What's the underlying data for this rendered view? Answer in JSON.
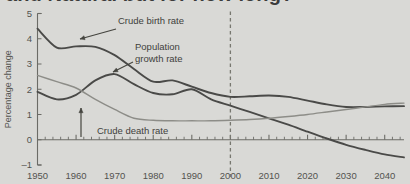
{
  "figure": {
    "title_partial": "and Natural but for how long?",
    "background_color": "#d9d9d6"
  },
  "chart_data": {
    "type": "line",
    "title": "and Natural but for how long?",
    "xlabel": "",
    "ylabel": "Percentage change",
    "x": [
      1950,
      1955,
      1960,
      1965,
      1970,
      1975,
      1980,
      1985,
      1990,
      1995,
      2000,
      2005,
      2010,
      2015,
      2020,
      2025,
      2030,
      2035,
      2040,
      2045
    ],
    "xlim": [
      1950,
      2045
    ],
    "ylim": [
      -1,
      5
    ],
    "xticks": [
      1950,
      1960,
      1970,
      1980,
      1990,
      2000,
      2010,
      2020,
      2030,
      2040
    ],
    "xticklabels": [
      "1950",
      "1960",
      "1970",
      "1980",
      "1990",
      "2000",
      "2010",
      "2020",
      "2030",
      "2040"
    ],
    "yticks": [
      -1,
      0,
      1,
      2,
      3,
      4,
      5
    ],
    "yticklabels": [
      "–1",
      "0",
      "1",
      "2",
      "3",
      "4",
      "5"
    ],
    "grid": false,
    "legend_position": "inline-annotations",
    "series": [
      {
        "name": "Crude birth rate",
        "color": "#4a4a48",
        "width": 1.9,
        "values": [
          4.4,
          3.65,
          3.7,
          3.68,
          3.35,
          2.8,
          2.3,
          2.35,
          2.1,
          1.85,
          1.7,
          1.72,
          1.75,
          1.7,
          1.55,
          1.4,
          1.3,
          1.3,
          1.32,
          1.33
        ]
      },
      {
        "name": "Population growth rate",
        "color": "#4a4a48",
        "width": 1.9,
        "values": [
          1.9,
          1.6,
          1.78,
          2.35,
          2.6,
          2.2,
          1.85,
          1.8,
          2.0,
          1.6,
          1.35,
          1.1,
          0.85,
          0.6,
          0.32,
          0.05,
          -0.2,
          -0.4,
          -0.58,
          -0.7
        ]
      },
      {
        "name": "Crude death rate",
        "color": "#8d8d88",
        "width": 1.4,
        "values": [
          2.55,
          2.3,
          2.05,
          1.6,
          1.2,
          0.85,
          0.77,
          0.75,
          0.75,
          0.75,
          0.77,
          0.8,
          0.85,
          0.92,
          1.0,
          1.1,
          1.2,
          1.3,
          1.4,
          1.45
        ]
      }
    ],
    "annotations": [
      {
        "name": "crude-birth-rate-label",
        "label": "Crude birth rate",
        "x_px": 118,
        "y_px": 24,
        "arrow_from": [
          116,
          29
        ],
        "arrow_to": [
          80,
          39
        ]
      },
      {
        "name": "population-growth-rate-label",
        "label_line1": "Population",
        "label_line2": "growth rate",
        "x_px": 135,
        "y_px": 50,
        "arrow_from": [
          133,
          62
        ],
        "arrow_to": [
          113,
          72
        ]
      },
      {
        "name": "crude-death-rate-label",
        "label": "Crude death rate",
        "x_px": 97,
        "y_px": 134
      },
      {
        "name": "death-rate-pointer-arrow",
        "label": "",
        "arrow_from": [
          81,
          137
        ],
        "arrow_to": [
          81,
          108
        ]
      },
      {
        "name": "projection-divider-2000",
        "label": "",
        "x_value": 2000,
        "style": "dashed-vertical"
      }
    ]
  }
}
